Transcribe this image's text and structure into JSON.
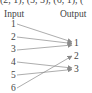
{
  "top_text": "(2, 1), (5, 3), (6, 1), (",
  "headers": {
    "input": "Input",
    "output": "Output"
  },
  "inputs": [
    "1",
    "2",
    "3",
    "4",
    "5",
    "6"
  ],
  "outputs": [
    "1",
    "2",
    "3"
  ],
  "mapping": [
    {
      "from": "1",
      "to": "1"
    },
    {
      "from": "2",
      "to": "1"
    },
    {
      "from": "3",
      "to": "1"
    },
    {
      "from": "4",
      "to": "3"
    },
    {
      "from": "5",
      "to": "3"
    },
    {
      "from": "6",
      "to": "2"
    }
  ],
  "colors": {
    "arrow": "#8a8a8a",
    "text": "#444444"
  }
}
